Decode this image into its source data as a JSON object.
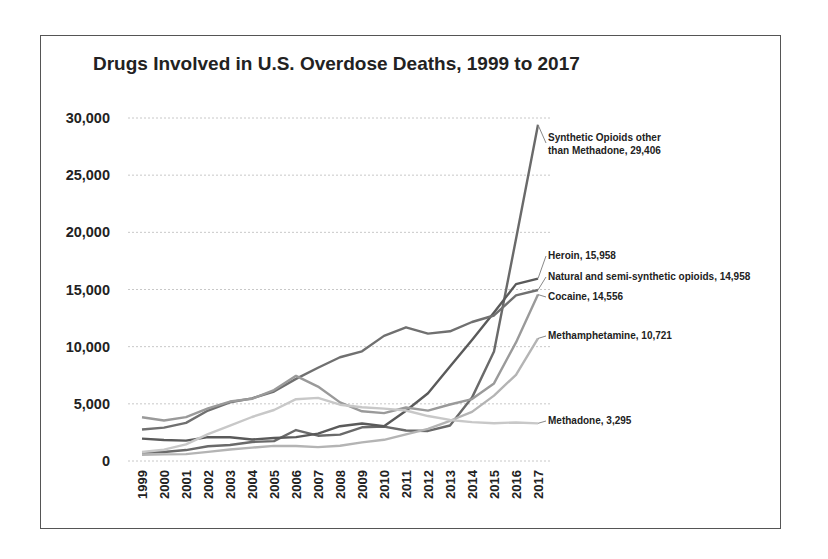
{
  "chart_data": {
    "type": "line",
    "title": "Drugs Involved in U.S. Overdose Deaths, 1999 to 2017",
    "xlabel": "",
    "ylabel": "",
    "ylim": [
      0,
      30000
    ],
    "yticks": [
      0,
      5000,
      10000,
      15000,
      20000,
      25000,
      30000
    ],
    "ytick_labels": [
      "0",
      "5,000",
      "10,000",
      "15,000",
      "20,000",
      "25,000",
      "30,000"
    ],
    "grid": true,
    "legend_position": "inline-right",
    "x": [
      "1999",
      "2000",
      "2001",
      "2002",
      "2003",
      "2004",
      "2005",
      "2006",
      "2007",
      "2008",
      "2009",
      "2010",
      "2011",
      "2012",
      "2013",
      "2014",
      "2015",
      "2016",
      "2017"
    ],
    "series": [
      {
        "name": "Synthetic Opioids other than Methadone",
        "label": "Synthetic Opioids other than Methadone, 29,406",
        "color": "#6a6a6a",
        "values": [
          730,
          782,
          957,
          1295,
          1400,
          1664,
          1742,
          2707,
          2213,
          2306,
          2946,
          3007,
          2666,
          2628,
          3105,
          5544,
          9580,
          19413,
          29406
        ]
      },
      {
        "name": "Heroin",
        "label": "Heroin, 15,958",
        "color": "#5a5a5a",
        "values": [
          1960,
          1842,
          1779,
          2089,
          2080,
          1878,
          2009,
          2088,
          2399,
          3041,
          3278,
          3036,
          4397,
          5925,
          8257,
          10574,
          12989,
          15469,
          15958
        ]
      },
      {
        "name": "Natural and semi-synthetic opioids",
        "label": "Natural and semi-synthetic opioids, 14,958",
        "color": "#707070",
        "values": [
          2749,
          2917,
          3335,
          4416,
          5135,
          5481,
          6077,
          7180,
          8158,
          9075,
          9593,
          10943,
          11693,
          11140,
          11346,
          12159,
          12727,
          14487,
          14958
        ]
      },
      {
        "name": "Cocaine",
        "label": "Cocaine, 14,556",
        "color": "#9a9a9a",
        "values": [
          3822,
          3544,
          3833,
          4599,
          5199,
          5443,
          6208,
          7448,
          6512,
          5129,
          4350,
          4183,
          4681,
          4404,
          4944,
          5415,
          6784,
          10375,
          14556
        ]
      },
      {
        "name": "Methamphetamine",
        "label": "Methamphetamine, 10,721",
        "color": "#b4b4b4",
        "values": [
          547,
          578,
          604,
          800,
          1009,
          1171,
          1320,
          1313,
          1218,
          1332,
          1632,
          1854,
          2325,
          2811,
          3520,
          4298,
          5716,
          7542,
          10721
        ]
      },
      {
        "name": "Methadone",
        "label": "Methadone, 3,295",
        "color": "#c8c8c8",
        "values": [
          784,
          988,
          1456,
          2358,
          3091,
          3849,
          4460,
          5406,
          5518,
          4924,
          4696,
          4577,
          4418,
          3932,
          3591,
          3400,
          3301,
          3373,
          3295
        ]
      }
    ]
  },
  "chart": {
    "title": "Drugs Involved in U.S. Overdose Deaths, 1999 to 2017"
  }
}
